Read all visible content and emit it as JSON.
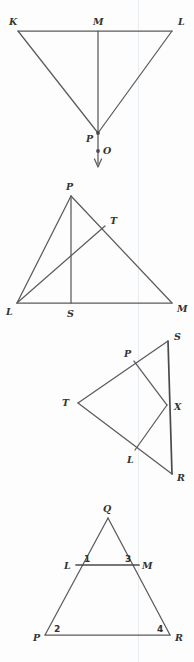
{
  "page": {
    "background_color": "#fdfdfd",
    "line_color": "#5b5b5b",
    "label_color": "#333333",
    "guide_color": "#dfe6ee",
    "width": 194,
    "height": 662
  },
  "figures": [
    {
      "id": "figure-1",
      "name": "triangle-klp-with-ray-mo",
      "labels": {
        "k": "K",
        "l": "L",
        "m": "M",
        "p": "P",
        "o": "O"
      }
    },
    {
      "id": "figure-2",
      "name": "triangle-plm-with-cevians",
      "labels": {
        "p": "P",
        "t": "T",
        "l": "L",
        "s": "S",
        "m": "M"
      }
    },
    {
      "id": "figure-3",
      "name": "triangle-srt-with-inscribed-plx",
      "labels": {
        "s": "S",
        "p": "P",
        "t": "T",
        "x": "X",
        "l": "L",
        "r": "R"
      }
    },
    {
      "id": "figure-4",
      "name": "triangle-pqr-with-midsegment-lm",
      "labels": {
        "q": "Q",
        "l": "L",
        "m": "M",
        "p": "P",
        "r": "R",
        "angle1": "1",
        "angle3": "3",
        "angle2": "2",
        "angle4": "4"
      }
    }
  ]
}
